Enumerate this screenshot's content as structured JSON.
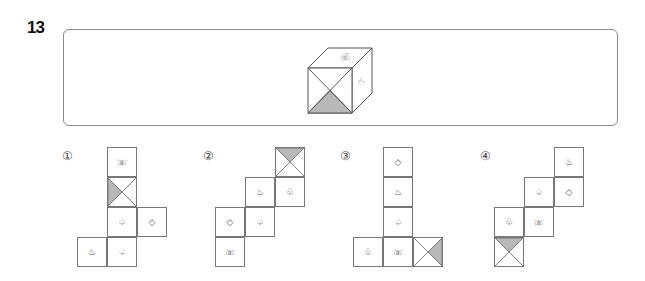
{
  "question": {
    "number": "13",
    "cube": {
      "top_face": "hand-icon",
      "right_face": "pointing-hand-icon",
      "front_face": "x-split bottom triangle shaded",
      "shade_color": "#b8b8b8"
    }
  },
  "options": [
    {
      "label": "①",
      "cells": [
        {
          "col": 1,
          "row": 0,
          "symbol": "☏",
          "name": "hand-icon"
        },
        {
          "col": 1,
          "row": 1,
          "symbol": "",
          "name": "x-face-left-shaded",
          "shade": "left"
        },
        {
          "col": 1,
          "row": 2,
          "symbol": "♤",
          "name": "spade-icon"
        },
        {
          "col": 2,
          "row": 2,
          "symbol": "◇",
          "name": "diamond-icon"
        },
        {
          "col": 0,
          "row": 3,
          "symbol": "♨",
          "name": "hot-spring-icon"
        },
        {
          "col": 1,
          "row": 3,
          "symbol": "♤",
          "name": "spade-icon"
        }
      ]
    },
    {
      "label": "②",
      "cells": [
        {
          "col": 2,
          "row": 0,
          "symbol": "",
          "name": "x-face-top-shaded",
          "shade": "top"
        },
        {
          "col": 1,
          "row": 1,
          "symbol": "♨",
          "name": "hot-spring-icon"
        },
        {
          "col": 2,
          "row": 1,
          "symbol": "♧",
          "name": "club-icon"
        },
        {
          "col": 0,
          "row": 2,
          "symbol": "◇",
          "name": "diamond-icon"
        },
        {
          "col": 1,
          "row": 2,
          "symbol": "♤",
          "name": "spade-icon"
        },
        {
          "col": 0,
          "row": 3,
          "symbol": "☏",
          "name": "hand-icon"
        }
      ]
    },
    {
      "label": "③",
      "cells": [
        {
          "col": 1,
          "row": 0,
          "symbol": "◇",
          "name": "diamond-icon"
        },
        {
          "col": 1,
          "row": 1,
          "symbol": "♨",
          "name": "hot-spring-icon"
        },
        {
          "col": 1,
          "row": 2,
          "symbol": "♤",
          "name": "spade-icon"
        },
        {
          "col": 0,
          "row": 3,
          "symbol": "♧",
          "name": "club-icon"
        },
        {
          "col": 1,
          "row": 3,
          "symbol": "☏",
          "name": "hand-icon"
        },
        {
          "col": 2,
          "row": 3,
          "symbol": "",
          "name": "x-face-right-shaded",
          "shade": "right"
        }
      ]
    },
    {
      "label": "④",
      "cells": [
        {
          "col": 2,
          "row": 0,
          "symbol": "♨",
          "name": "hot-spring-icon"
        },
        {
          "col": 1,
          "row": 1,
          "symbol": "♤",
          "name": "spade-icon"
        },
        {
          "col": 2,
          "row": 1,
          "symbol": "◇",
          "name": "diamond-icon"
        },
        {
          "col": 0,
          "row": 2,
          "symbol": "♧",
          "name": "club-icon"
        },
        {
          "col": 1,
          "row": 2,
          "symbol": "☏",
          "name": "hand-icon"
        },
        {
          "col": 0,
          "row": 3,
          "symbol": "",
          "name": "x-face-top-shaded",
          "shade": "top"
        }
      ]
    }
  ],
  "layout": {
    "option_label_x": [
      62,
      203,
      340,
      480
    ],
    "net_origin_x": [
      77,
      215,
      353,
      494
    ],
    "net_origin_y": 147,
    "cell": 30
  }
}
